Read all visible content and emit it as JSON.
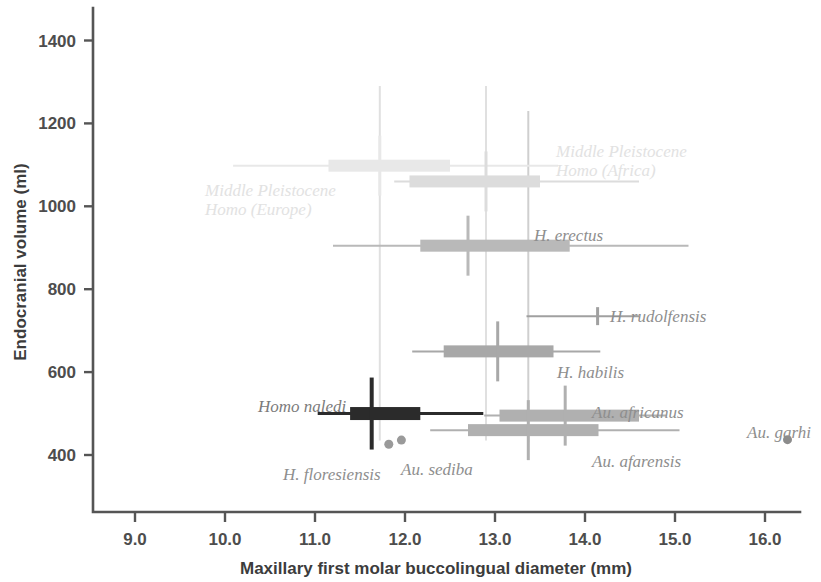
{
  "chart_data": {
    "type": "bar",
    "title": "",
    "subtitle": "",
    "xlabel": "Maxillary first molar buccolingual diameter (mm)",
    "ylabel": "Endocranial volume (ml)",
    "xlim": [
      8.55,
      16.35
    ],
    "ylim": [
      355,
      1480
    ],
    "xticks": [
      "9.0",
      "10.0",
      "11.0",
      "12.0",
      "13.0",
      "14.0",
      "15.0",
      "16.0"
    ],
    "xtickvalues": [
      9.0,
      10.0,
      11.0,
      12.0,
      13.0,
      14.0,
      15.0,
      16.0
    ],
    "yticks": [
      "400",
      "600",
      "800",
      "1000",
      "1200",
      "1400"
    ],
    "ytickvalues": [
      400,
      600,
      800,
      1000,
      1200,
      1400
    ],
    "grid": false,
    "legend": false,
    "orientation": "horizontal-box-whisker",
    "series": [
      {
        "name": "Middle Pleistocene Homo (Europe)",
        "label": "Middle Pleistocene\nHomo (Europe)",
        "label_lines": [
          "Middle Pleistocene",
          "Homo (Europe)"
        ],
        "y": 1098,
        "whisker_min": 10.09,
        "box_min": 11.15,
        "median": 11.72,
        "box_max": 12.5,
        "whisker_max": 13.7,
        "color": "#e8e8e8",
        "style": "very-faint",
        "label_position": "below-left"
      },
      {
        "name": "Middle Pleistocene Homo (Africa)",
        "label": "Middle Pleistocene\nHomo (Africa)",
        "label_lines": [
          "Middle Pleistocene",
          "Homo (Africa)"
        ],
        "y": 1060,
        "whisker_min": 11.88,
        "box_min": 12.05,
        "median": 12.9,
        "box_max": 13.5,
        "whisker_max": 14.6,
        "color": "#dcdcdc",
        "style": "faint",
        "label_position": "above-right"
      },
      {
        "name": "H. erectus",
        "label": "H. erectus",
        "label_lines": [
          "H. erectus"
        ],
        "y": 905,
        "whisker_min": 11.2,
        "box_min": 12.17,
        "median": 12.7,
        "box_max": 13.83,
        "whisker_max": 15.15,
        "color": "#b9b9b9",
        "style": "medium",
        "label_position": "above-right"
      },
      {
        "name": "H. rudolfensis",
        "label": "H. rudolfensis",
        "label_lines": [
          "H. rudolfensis"
        ],
        "y": 735,
        "whisker_min": 13.35,
        "box_min": null,
        "median": 14.14,
        "box_max": null,
        "whisker_max": 14.6,
        "color": "#a0a0a0",
        "style": "line-only",
        "label_position": "above-right"
      },
      {
        "name": "H. habilis",
        "label": "H. habilis",
        "label_lines": [
          "H. habilis"
        ],
        "y": 650,
        "whisker_min": 12.08,
        "box_min": 12.43,
        "median": 13.03,
        "box_max": 13.65,
        "whisker_max": 14.17,
        "color": "#a8a8a8",
        "style": "medium",
        "label_position": "below-right"
      },
      {
        "name": "Au. africanus",
        "label": "Au. africanus",
        "label_lines": [
          "Au. africanus"
        ],
        "y": 495,
        "whisker_min": 12.88,
        "box_min": 13.05,
        "median": 13.78,
        "box_max": 14.6,
        "whisker_max": 14.9,
        "color": "#b0b0b0",
        "style": "medium",
        "label_position": "above-right"
      },
      {
        "name": "Au. afarensis",
        "label": "Au. afarensis",
        "label_lines": [
          "Au. afarensis"
        ],
        "y": 460,
        "whisker_min": 12.28,
        "box_min": 12.7,
        "median": 13.37,
        "box_max": 14.15,
        "whisker_max": 15.05,
        "color": "#b0b0b0",
        "style": "medium",
        "label_position": "below-right"
      },
      {
        "name": "Homo naledi",
        "label": "Homo naledi",
        "label_lines": [
          "Homo naledi"
        ],
        "y": 500,
        "whisker_min": 11.03,
        "box_min": 11.39,
        "median": 11.63,
        "box_max": 12.17,
        "whisker_max": 12.87,
        "color": "#2b2b2b",
        "style": "dark",
        "label_position": "above-left"
      }
    ],
    "points": [
      {
        "name": "H. floresiensis",
        "label": "H. floresiensis",
        "x": 11.82,
        "y": 426,
        "color": "#9a9a9a",
        "label_position": "below-left"
      },
      {
        "name": "Au. sediba",
        "label": "Au. sediba",
        "x": 11.96,
        "y": 436,
        "color": "#9a9a9a",
        "label_position": "below-right"
      },
      {
        "name": "Au. garhi",
        "label": "Au. garhi",
        "x": 16.25,
        "y": 437,
        "color": "#8c8c8c",
        "label_position": "above"
      }
    ],
    "reference_lines": [
      {
        "x": 11.72,
        "y_min": 435,
        "y_max": 1290,
        "color": "#e0e0e0"
      },
      {
        "x": 12.9,
        "y_min": 435,
        "y_max": 1290,
        "color": "#e0e0e0"
      },
      {
        "x": 13.37,
        "y_min": 430,
        "y_max": 1230,
        "color": "#cfcfcf"
      }
    ]
  },
  "axes": {
    "x_title": "Maxillary first molar buccolingual diameter (mm)",
    "y_title": "Endocranial volume (ml)"
  }
}
